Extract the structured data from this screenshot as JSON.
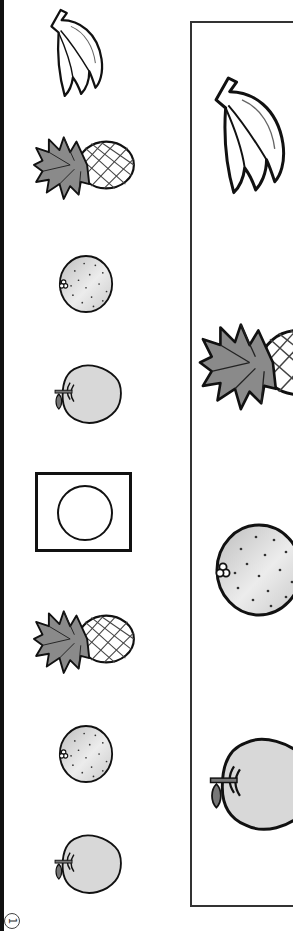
{
  "sheet": {
    "page_number": "1",
    "left_column": {
      "sequence": [
        {
          "fruit": "banana",
          "icon": "banana-icon"
        },
        {
          "fruit": "pineapple",
          "icon": "pineapple-icon"
        },
        {
          "fruit": "orange",
          "icon": "orange-icon"
        },
        {
          "fruit": "apple",
          "icon": "apple-icon"
        },
        {
          "fruit": "blank",
          "icon": "circle-answer-box"
        },
        {
          "fruit": "pineapple",
          "icon": "pineapple-icon"
        },
        {
          "fruit": "orange",
          "icon": "orange-icon"
        },
        {
          "fruit": "apple",
          "icon": "apple-icon"
        }
      ]
    },
    "choice_panel": {
      "options": [
        {
          "fruit": "banana",
          "icon": "banana-icon"
        },
        {
          "fruit": "pineapple",
          "icon": "pineapple-icon"
        },
        {
          "fruit": "orange",
          "icon": "orange-icon"
        },
        {
          "fruit": "apple",
          "icon": "apple-icon"
        }
      ]
    },
    "colors": {
      "outline": "#111111",
      "fruit_fill": "#d8d8d8",
      "leaf_fill": "#8a8a8a",
      "frame": "#333333"
    }
  }
}
